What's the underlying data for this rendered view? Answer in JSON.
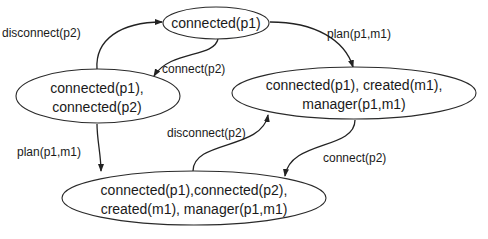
{
  "diagram": {
    "type": "state-transition-diagram",
    "colors": {
      "stroke": "#222222",
      "text": "#1a1a1a",
      "background": "#ffffff"
    },
    "nodes": [
      {
        "id": "s1",
        "lines": [
          "connected(p1)"
        ]
      },
      {
        "id": "s2",
        "lines": [
          "connected(p1),",
          "connected(p2)"
        ]
      },
      {
        "id": "s3",
        "lines": [
          "connected(p1), created(m1),",
          "manager(p1,m1)"
        ]
      },
      {
        "id": "s4",
        "lines": [
          "connected(p1),connected(p2),",
          "created(m1), manager(p1,m1)"
        ]
      }
    ],
    "edges": [
      {
        "id": "e1",
        "from": "s2",
        "to": "s1",
        "label": "disconnect(p2)"
      },
      {
        "id": "e2",
        "from": "s1",
        "to": "s2",
        "label": "connect(p2)"
      },
      {
        "id": "e3",
        "from": "s1",
        "to": "s3",
        "label": "plan(p1,m1)"
      },
      {
        "id": "e4",
        "from": "s2",
        "to": "s4",
        "label": "plan(p1,m1)"
      },
      {
        "id": "e5",
        "from": "s4",
        "to": "s3",
        "label": "disconnect(p2)"
      },
      {
        "id": "e6",
        "from": "s3",
        "to": "s4",
        "label": "connect(p2)"
      }
    ]
  }
}
